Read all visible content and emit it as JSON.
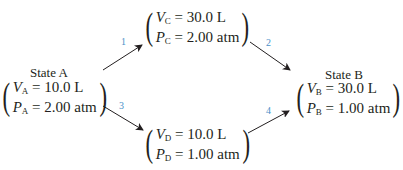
{
  "diagram": {
    "states": {
      "A": {
        "title": "State A",
        "v_label": "V",
        "v_sub": "A",
        "v_value": "= 10.0 L",
        "p_label": "P",
        "p_sub": "A",
        "p_value": "= 2.00 atm"
      },
      "C": {
        "v_label": "V",
        "v_sub": "C",
        "v_value": "= 30.0 L",
        "p_label": "P",
        "p_sub": "C",
        "p_value": "= 2.00 atm"
      },
      "B": {
        "title": "State B",
        "v_label": "V",
        "v_sub": "B",
        "v_value": "= 30.0 L",
        "p_label": "P",
        "p_sub": "B",
        "p_value": "= 1.00 atm"
      },
      "D": {
        "v_label": "V",
        "v_sub": "D",
        "v_value": "= 10.0 L",
        "p_label": "P",
        "p_sub": "D",
        "p_value": "= 1.00 atm"
      }
    },
    "steps": [
      {
        "label": "1",
        "from": "A",
        "to": "C"
      },
      {
        "label": "2",
        "from": "C",
        "to": "B"
      },
      {
        "label": "3",
        "from": "A",
        "to": "D"
      },
      {
        "label": "4",
        "from": "D",
        "to": "B"
      }
    ],
    "colors": {
      "step_label": "#4a90c8",
      "text": "#231f20",
      "arrow": "#231f20"
    }
  }
}
